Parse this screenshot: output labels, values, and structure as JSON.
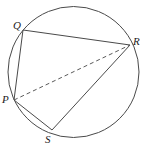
{
  "figure": {
    "stroke_color": "#4a4a4a",
    "dash_color": "#5a5a5a",
    "label_color": "#1c1c1c",
    "background": "#ffffff",
    "circle": {
      "name": "circumscribed-circle",
      "cx": 73.5,
      "cy": 72,
      "r": 65.5,
      "stroke_width": 1
    },
    "points": [
      {
        "id": "Q",
        "label": "Q",
        "x": 23,
        "y": 30,
        "label_x": 13,
        "label_y": 20
      },
      {
        "id": "R",
        "label": "R",
        "x": 130,
        "y": 45,
        "label_x": 133,
        "label_y": 36
      },
      {
        "id": "P",
        "label": "P",
        "x": 14,
        "y": 100,
        "label_x": 2,
        "label_y": 94
      },
      {
        "id": "S",
        "label": "S",
        "x": 52,
        "y": 130,
        "label_x": 45,
        "label_y": 134
      }
    ],
    "segments": [
      {
        "id": "QR",
        "from": "Q",
        "to": "R",
        "style": "solid",
        "x1": 23,
        "y1": 30,
        "x2": 130,
        "y2": 45
      },
      {
        "id": "QP",
        "from": "Q",
        "to": "P",
        "style": "solid",
        "x1": 23,
        "y1": 30,
        "x2": 14,
        "y2": 100
      },
      {
        "id": "PS",
        "from": "P",
        "to": "S",
        "style": "solid",
        "x1": 14,
        "y1": 100,
        "x2": 52,
        "y2": 130
      },
      {
        "id": "SR",
        "from": "S",
        "to": "R",
        "style": "solid",
        "x1": 52,
        "y1": 130,
        "x2": 130,
        "y2": 45
      },
      {
        "id": "PR",
        "from": "P",
        "to": "R",
        "style": "dashed",
        "x1": 14,
        "y1": 100,
        "x2": 130,
        "y2": 45
      }
    ]
  }
}
